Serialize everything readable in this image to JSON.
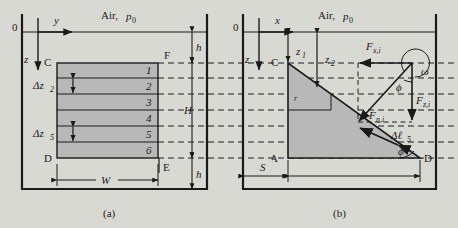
{
  "figure": {
    "background_color": "#d9d9d4",
    "ink_color": "#1a1a1a",
    "fill_color": "#b8b8b8",
    "panels": [
      {
        "id": "a",
        "caption": "(a)",
        "axes": {
          "origin": "0",
          "horizontal": "y",
          "vertical": "z"
        },
        "ambient_label": "Air,",
        "ambient_pressure": "p",
        "ambient_pressure_sub": "0",
        "corner_labels": {
          "top_left": "C",
          "bottom_left": "D",
          "top_right": "F",
          "bottom_right": "E"
        },
        "dimensions": [
          {
            "name": "h-top",
            "label": "h"
          },
          {
            "name": "H-total",
            "label": "H"
          },
          {
            "name": "h-bottom",
            "label": "h"
          },
          {
            "name": "W-width",
            "label": "W"
          }
        ],
        "layer_thickness_labels": [
          {
            "name": "delta-z-2",
            "symbol": "Δz",
            "sub": "2"
          },
          {
            "name": "delta-z-5",
            "symbol": "Δz",
            "sub": "5"
          }
        ],
        "layers": [
          "1",
          "2",
          "3",
          "4",
          "5",
          "6"
        ]
      },
      {
        "id": "b",
        "caption": "(b)",
        "axes": {
          "origin": "0",
          "horizontal": "x",
          "vertical": "z"
        },
        "ambient_label": "Air,",
        "ambient_pressure": "p",
        "ambient_pressure_sub": "0",
        "corner_labels": {
          "top_left": "C",
          "bottom_left": "A",
          "bottom_right": "D"
        },
        "depth_labels": [
          {
            "name": "z1",
            "symbol": "z",
            "sub": "1"
          },
          {
            "name": "z2",
            "symbol": "z",
            "sub": "2"
          }
        ],
        "radius_label": "r",
        "offset_label": "S",
        "forces": [
          {
            "name": "Fx",
            "symbol": "F",
            "sub": "x,i"
          },
          {
            "name": "Fz",
            "symbol": "F",
            "sub": "z,i"
          },
          {
            "name": "Fn",
            "symbol": "F",
            "sub": "n,i"
          }
        ],
        "angles": [
          {
            "name": "omega",
            "symbol": "ω"
          },
          {
            "name": "phi-force",
            "symbol": "ϕ"
          },
          {
            "name": "phi-wedge",
            "symbol": "ϕ"
          }
        ],
        "segment_label": {
          "symbol": "Δℓ",
          "sub": "5"
        }
      }
    ]
  }
}
